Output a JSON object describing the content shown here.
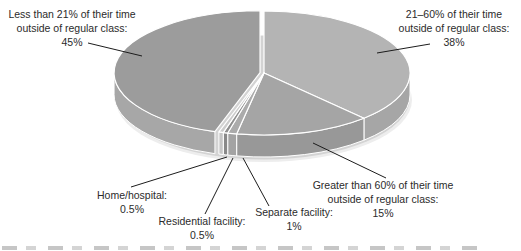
{
  "background": "#ffffff",
  "border_color": "#ffffff",
  "text_color": "#2b2b2b",
  "chart_data": {
    "type": "pie",
    "style": "3d",
    "title": "",
    "start_angle_deg": 0,
    "clockwise": true,
    "total": 100,
    "slices": [
      {
        "label": "21–60% of their time outside of regular class",
        "value": 38,
        "pct_label": "38%",
        "color_top": "#b4b4b4",
        "color_side": "#a6a6a6",
        "exploded": false
      },
      {
        "label": "Greater than 60% of their time outside of regular class",
        "value": 15,
        "pct_label": "15%",
        "color_top": "#a5a5a5",
        "color_side": "#989898",
        "exploded": false
      },
      {
        "label": "Separate facility",
        "value": 1,
        "pct_label": "1%",
        "color_top": "#ababab",
        "color_side": "#a3a3a3",
        "exploded": false
      },
      {
        "label": "Residential facility",
        "value": 0.5,
        "pct_label": "0.5%",
        "color_top": "#8f8f8f",
        "color_side": "#898989",
        "exploded": false
      },
      {
        "label": "Home/hospital",
        "value": 0.5,
        "pct_label": "0.5%",
        "color_top": "#cccccc",
        "color_side": "#c6c6c6",
        "exploded": false
      },
      {
        "label": "Less than 21% of their time outside of regular class",
        "value": 45,
        "pct_label": "45%",
        "color_top": "#9c9c9c",
        "color_side": "#a7a7a7",
        "exploded": true
      }
    ]
  },
  "callouts": {
    "less21": {
      "lines": [
        "Less than 21% of their time",
        "outside of regular class:"
      ],
      "pct": "45%"
    },
    "t2160": {
      "lines": [
        "21–60% of their time",
        "outside of regular class:"
      ],
      "pct": "38%"
    },
    "home": {
      "lines": [
        "Home/hospital:"
      ],
      "pct": "0.5%"
    },
    "residential": {
      "lines": [
        "Residential facility:"
      ],
      "pct": "0.5%"
    },
    "separate": {
      "lines": [
        "Separate facility:"
      ],
      "pct": "1%"
    },
    "greater60": {
      "lines": [
        "Greater than 60% of their time",
        "outside of regular class:"
      ],
      "pct": "15%"
    }
  }
}
